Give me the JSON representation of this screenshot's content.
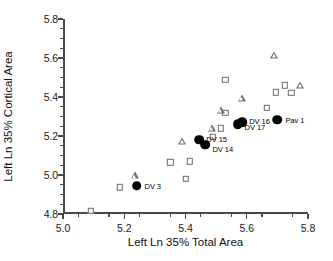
{
  "chart_data": {
    "type": "scatter",
    "title": "",
    "xlabel": "Left Ln 35% Total Area",
    "ylabel": "Left Ln 35% Cortical Area",
    "xlim": [
      5.0,
      5.8
    ],
    "ylim": [
      4.8,
      5.8
    ],
    "xticks": [
      "5.0",
      "5.2",
      "5.4",
      "5.6",
      "5.8"
    ],
    "xtick_values": [
      5.0,
      5.2,
      5.4,
      5.6,
      5.8
    ],
    "yticks": [
      "4.8",
      "5.0",
      "5.2",
      "5.4",
      "5.6",
      "5.8"
    ],
    "ytick_values": [
      4.8,
      5.0,
      5.2,
      5.4,
      5.6,
      5.8
    ],
    "xminor_values": [
      5.05,
      5.15,
      5.25,
      5.35,
      5.45,
      5.55,
      5.65,
      5.75
    ],
    "yminor_values": [
      4.85,
      4.9,
      4.95,
      5.05,
      5.1,
      5.15,
      5.25,
      5.3,
      5.35,
      5.45,
      5.5,
      5.55,
      5.65,
      5.7,
      5.75
    ],
    "grid": false,
    "legend": "none",
    "series": [
      {
        "name": "open-square",
        "marker": "square",
        "fill": "none",
        "edge_color": "#6b6b6b",
        "points": [
          {
            "x": 5.09,
            "y": 4.815
          },
          {
            "x": 5.185,
            "y": 4.937
          },
          {
            "x": 5.35,
            "y": 5.065
          },
          {
            "x": 5.4,
            "y": 4.982
          },
          {
            "x": 5.415,
            "y": 5.07
          },
          {
            "x": 5.49,
            "y": 5.195
          },
          {
            "x": 5.515,
            "y": 5.24
          },
          {
            "x": 5.53,
            "y": 5.32
          },
          {
            "x": 5.53,
            "y": 5.487
          },
          {
            "x": 5.665,
            "y": 5.345
          },
          {
            "x": 5.695,
            "y": 5.425
          },
          {
            "x": 5.725,
            "y": 5.46
          },
          {
            "x": 5.745,
            "y": 5.42
          }
        ]
      },
      {
        "name": "open-triangle",
        "marker": "triangle",
        "fill": "none",
        "edge_color": "#6f6f6f",
        "points": [
          {
            "x": 5.235,
            "y": 4.998
          },
          {
            "x": 5.39,
            "y": 5.175
          },
          {
            "x": 5.485,
            "y": 5.24
          },
          {
            "x": 5.515,
            "y": 5.335
          },
          {
            "x": 5.585,
            "y": 5.395
          },
          {
            "x": 5.69,
            "y": 5.615
          },
          {
            "x": 5.775,
            "y": 5.46
          }
        ]
      },
      {
        "name": "filled-circle-labeled",
        "marker": "circle",
        "fill": "#000000",
        "edge_color": "#000000",
        "points": [
          {
            "x": 5.24,
            "y": 4.945,
            "label": "DV 3",
            "label_dx": 8,
            "label_dy": 0
          },
          {
            "x": 5.465,
            "y": 5.155,
            "label": "DV 14",
            "label_dx": 7,
            "label_dy": 4
          },
          {
            "x": 5.445,
            "y": 5.182,
            "label": "DV 15",
            "label_dx": 7,
            "label_dy": -1
          },
          {
            "x": 5.57,
            "y": 5.262,
            "label": "DV 17",
            "label_dx": 7,
            "label_dy": 3
          },
          {
            "x": 5.585,
            "y": 5.272,
            "label": "DV 16",
            "label_dx": 7,
            "label_dy": -1
          },
          {
            "x": 5.7,
            "y": 5.283,
            "label": "Pav 1",
            "label_dx": 8,
            "label_dy": 0
          }
        ]
      }
    ]
  }
}
